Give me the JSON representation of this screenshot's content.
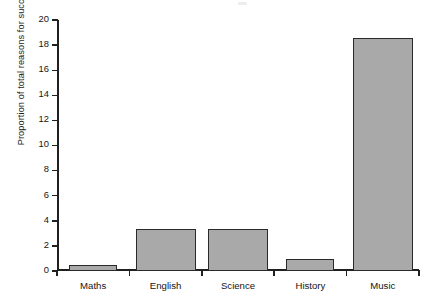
{
  "chart_data": {
    "type": "bar",
    "title": "",
    "xlabel": "",
    "ylabel": "Proportion of total reasons for success",
    "categories": [
      "Maths",
      "English",
      "Science",
      "History",
      "Music"
    ],
    "values": [
      0.5,
      3.35,
      3.35,
      0.95,
      18.6
    ],
    "ylim": [
      0,
      20
    ],
    "ytick_labels": [
      "0",
      "2",
      "4",
      "6",
      "8",
      "10",
      "12",
      "14",
      "16",
      "18",
      "20"
    ],
    "ytick_values": [
      0,
      2,
      4,
      6,
      8,
      10,
      12,
      14,
      16,
      18,
      20
    ],
    "grid": false,
    "legend": null,
    "bar_color": "#a9a9a9",
    "bar_edge_color": "#2a2a2a",
    "axis_color": "#202020",
    "background": "#ffffff",
    "bar_widths": [
      48,
      60,
      60,
      48,
      60
    ]
  }
}
